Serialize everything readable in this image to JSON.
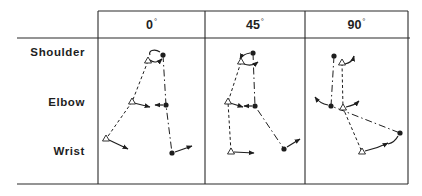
{
  "figure": {
    "row_labels": {
      "shoulder": "Shoulder",
      "elbow": "Elbow",
      "wrist": "Wrist"
    },
    "columns": [
      {
        "angle": "0",
        "degree_symbol": "°",
        "joints_reference_triangle": {
          "shoulder": [
            148,
            61
          ],
          "elbow": [
            132,
            102
          ],
          "wrist": [
            106,
            139
          ]
        },
        "joints_moved_dot": {
          "shoulder": [
            163,
            55
          ],
          "elbow": [
            166,
            105
          ],
          "wrist": [
            172,
            153
          ]
        }
      },
      {
        "angle": "45",
        "degree_symbol": "°",
        "joints_reference_triangle": {
          "shoulder": [
            241,
            62
          ],
          "elbow": [
            228,
            102
          ],
          "wrist": [
            231,
            152
          ]
        },
        "joints_moved_dot": {
          "shoulder": [
            253,
            53
          ],
          "elbow": [
            255,
            106
          ],
          "wrist": [
            284,
            149
          ]
        }
      },
      {
        "angle": "90",
        "degree_symbol": "°",
        "joints_reference_triangle": {
          "shoulder": [
            342,
            63
          ],
          "elbow": [
            343,
            108
          ],
          "wrist": [
            362,
            152
          ]
        },
        "joints_moved_dot": {
          "shoulder": [
            334,
            56
          ],
          "elbow": [
            331,
            106
          ],
          "wrist": [
            400,
            133
          ]
        }
      }
    ],
    "legend_semantics": {
      "triangle": "reference (dashed) limb posture",
      "dot": "moved (dash-dot) limb posture",
      "arrows": "joint rotation direction"
    },
    "colors": {
      "ink": "#1e1e1e",
      "background": "#ffffff"
    }
  }
}
